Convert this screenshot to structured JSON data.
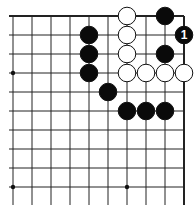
{
  "board": {
    "cols": 10,
    "rows": 10,
    "origin_x": 13,
    "origin_y": 16,
    "spacing": 19,
    "top_edge": true,
    "right_edge": true,
    "line_color": "#222222",
    "star_points": [
      [
        0,
        3
      ],
      [
        0,
        9
      ],
      [
        6,
        9
      ]
    ],
    "stones": [
      {
        "color": "white",
        "col": 6,
        "row": 0
      },
      {
        "color": "black",
        "col": 8,
        "row": 0
      },
      {
        "color": "black",
        "col": 4,
        "row": 1
      },
      {
        "color": "white",
        "col": 6,
        "row": 1
      },
      {
        "color": "black",
        "col": 9,
        "row": 1,
        "label": "1"
      },
      {
        "color": "black",
        "col": 4,
        "row": 2
      },
      {
        "color": "white",
        "col": 6,
        "row": 2
      },
      {
        "color": "black",
        "col": 8,
        "row": 2
      },
      {
        "color": "black",
        "col": 4,
        "row": 3
      },
      {
        "color": "white",
        "col": 6,
        "row": 3
      },
      {
        "color": "white",
        "col": 7,
        "row": 3
      },
      {
        "color": "white",
        "col": 8,
        "row": 3
      },
      {
        "color": "white",
        "col": 9,
        "row": 3
      },
      {
        "color": "black",
        "col": 5,
        "row": 4
      },
      {
        "color": "black",
        "col": 6,
        "row": 5
      },
      {
        "color": "black",
        "col": 7,
        "row": 5
      },
      {
        "color": "black",
        "col": 8,
        "row": 5
      }
    ]
  }
}
